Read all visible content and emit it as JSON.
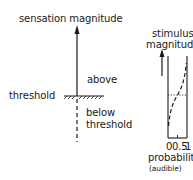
{
  "left_diagram": {
    "axis_label": "sensation magnitude",
    "above_label": "above",
    "threshold_label": "threshold",
    "below_label_line1": "below",
    "below_label_line2": "threshold"
  },
  "right_diagram": {
    "axis_label_line1": "stimulus",
    "axis_label_line2": "magnitude",
    "x_ticks": [
      "0",
      "0.5",
      "1"
    ],
    "x_label": "probability",
    "x_sublabel": "(audible)"
  },
  "colors": {
    "ink": "#1a1a1a",
    "background": "#ffffff"
  }
}
